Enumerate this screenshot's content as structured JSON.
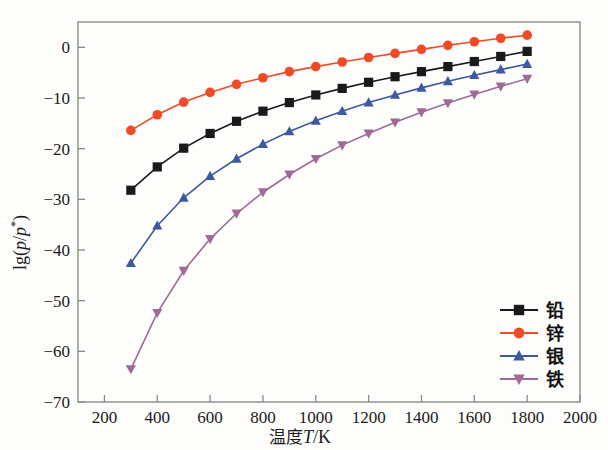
{
  "chart_data": {
    "type": "line",
    "title": "",
    "xlabel": "温度T/K",
    "ylabel": "lg(p/p*)",
    "xlim": [
      100,
      2000
    ],
    "ylim": [
      -70,
      5
    ],
    "xticks": [
      200,
      400,
      600,
      800,
      1000,
      1200,
      1400,
      1600,
      1800,
      2000
    ],
    "yticks": [
      0,
      -10,
      -20,
      -30,
      -40,
      -50,
      -60,
      -70
    ],
    "xtick_labels": [
      "200",
      "400",
      "600",
      "800",
      "1000",
      "1200",
      "1400",
      "1600",
      "1800",
      "2000"
    ],
    "ytick_labels": [
      "0",
      "−10",
      "−20",
      "−30",
      "−40",
      "−50",
      "−60",
      "−70"
    ],
    "grid": false,
    "legend_position": "lower-right",
    "x": [
      300,
      400,
      500,
      600,
      700,
      800,
      900,
      1000,
      1100,
      1200,
      1300,
      1400,
      1500,
      1600,
      1700,
      1800
    ],
    "series": [
      {
        "name": "铅",
        "label": "铅",
        "color": "#1a1a1a",
        "marker": "square",
        "values": [
          -28.2,
          -23.6,
          -19.9,
          -17.0,
          -14.6,
          -12.6,
          -10.9,
          -9.4,
          -8.1,
          -6.9,
          -5.8,
          -4.8,
          -3.8,
          -2.8,
          -1.8,
          -0.8
        ]
      },
      {
        "name": "锌",
        "label": "锌",
        "color": "#f04b28",
        "marker": "circle",
        "values": [
          -16.4,
          -13.3,
          -10.8,
          -8.9,
          -7.3,
          -6.0,
          -4.8,
          -3.8,
          -2.9,
          -2.0,
          -1.2,
          -0.4,
          0.4,
          1.1,
          1.8,
          2.4
        ]
      },
      {
        "name": "银",
        "label": "银",
        "color": "#3d5a9e",
        "marker": "triangle-up",
        "values": [
          -42.6,
          -35.2,
          -29.7,
          -25.4,
          -22.0,
          -19.1,
          -16.6,
          -14.5,
          -12.6,
          -10.9,
          -9.4,
          -8.0,
          -6.7,
          -5.5,
          -4.4,
          -3.3
        ]
      },
      {
        "name": "铁",
        "label": "铁",
        "color": "#a06a96",
        "marker": "triangle-down",
        "values": [
          -63.5,
          -52.4,
          -44.1,
          -37.8,
          -32.8,
          -28.6,
          -25.1,
          -22.0,
          -19.3,
          -17.0,
          -14.8,
          -12.8,
          -11.0,
          -9.3,
          -7.7,
          -6.2
        ]
      }
    ]
  },
  "axes": {
    "ylabel": "lg(p/p*)",
    "xlabel": "温度T/K"
  }
}
